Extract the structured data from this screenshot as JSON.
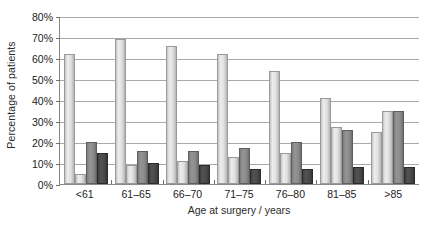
{
  "chart_data": {
    "type": "bar",
    "title": "",
    "xlabel": "Age at surgery / years",
    "ylabel": "Percentage of patients",
    "categories": [
      "<61",
      "61–65",
      "66–70",
      "71–75",
      "76–80",
      "81–85",
      ">85"
    ],
    "ylim": [
      0,
      80
    ],
    "ytick_values": [
      0,
      10,
      20,
      30,
      40,
      50,
      60,
      70,
      80
    ],
    "ytick_labels": [
      "0%",
      "10%",
      "20%",
      "30%",
      "40%",
      "50%",
      "60%",
      "70%",
      "80%"
    ],
    "grid": true,
    "legend": "none",
    "series": [
      {
        "name": "series-1",
        "color": "#e2e2e2",
        "values": [
          61,
          68,
          65,
          61,
          53,
          40,
          24
        ]
      },
      {
        "name": "series-2",
        "color": "#e2e2e2",
        "values": [
          4,
          8,
          10,
          12,
          14,
          26,
          34
        ]
      },
      {
        "name": "series-3",
        "color": "#8b8b8b",
        "values": [
          19,
          15,
          15,
          16,
          19,
          25,
          34
        ]
      },
      {
        "name": "series-4",
        "color": "#494949",
        "values": [
          14,
          9,
          8,
          6,
          6,
          7,
          7
        ]
      }
    ]
  },
  "colors": {
    "background": "#ffffff",
    "axis": "#8a8a8a",
    "gridline": "#a9a9a9",
    "text": "#1c1c1c",
    "bar_light": "#e2e2e2",
    "bar_medium": "#8b8b8b",
    "bar_dark": "#494949"
  }
}
